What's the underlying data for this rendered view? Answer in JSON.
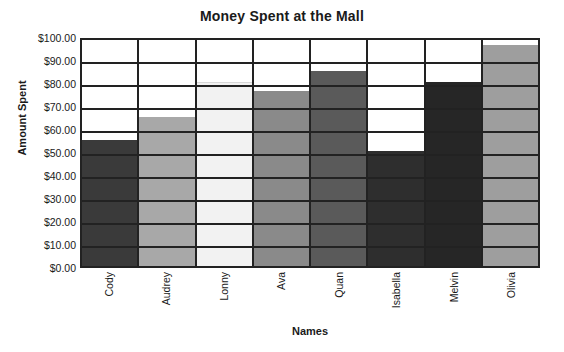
{
  "chart_data": {
    "type": "bar",
    "title": "Money Spent at the Mall",
    "xlabel": "Names",
    "ylabel": "Amount Spent",
    "categories": [
      "Cody",
      "Audrey",
      "Lonny",
      "Ava",
      "Quan",
      "Isabella",
      "Melvin",
      "Olivia"
    ],
    "values": [
      55,
      65,
      80,
      76,
      85,
      50,
      80,
      96
    ],
    "ylim": [
      0,
      100
    ],
    "ytick_step": 10,
    "ytick_labels": [
      "$100.00",
      "$90.00",
      "$80.00",
      "$70.00",
      "$60.00",
      "$50.00",
      "$40.00",
      "$30.00",
      "$20.00",
      "$10.00",
      "$0.00"
    ],
    "ytick_values": [
      100,
      90,
      80,
      70,
      60,
      50,
      40,
      30,
      20,
      10,
      0
    ],
    "grid": "horizontal-and-vertical",
    "legend": "none",
    "bar_colors": [
      "#3a3a3a",
      "#a8a8a8",
      "#f2f2f2",
      "#8a8a8a",
      "#5a5a5a",
      "#2e2e2e",
      "#262626",
      "#9e9e9e"
    ],
    "axis_color": "#222222",
    "background_color": "#ffffff",
    "text_color": "#1a1a1a"
  }
}
